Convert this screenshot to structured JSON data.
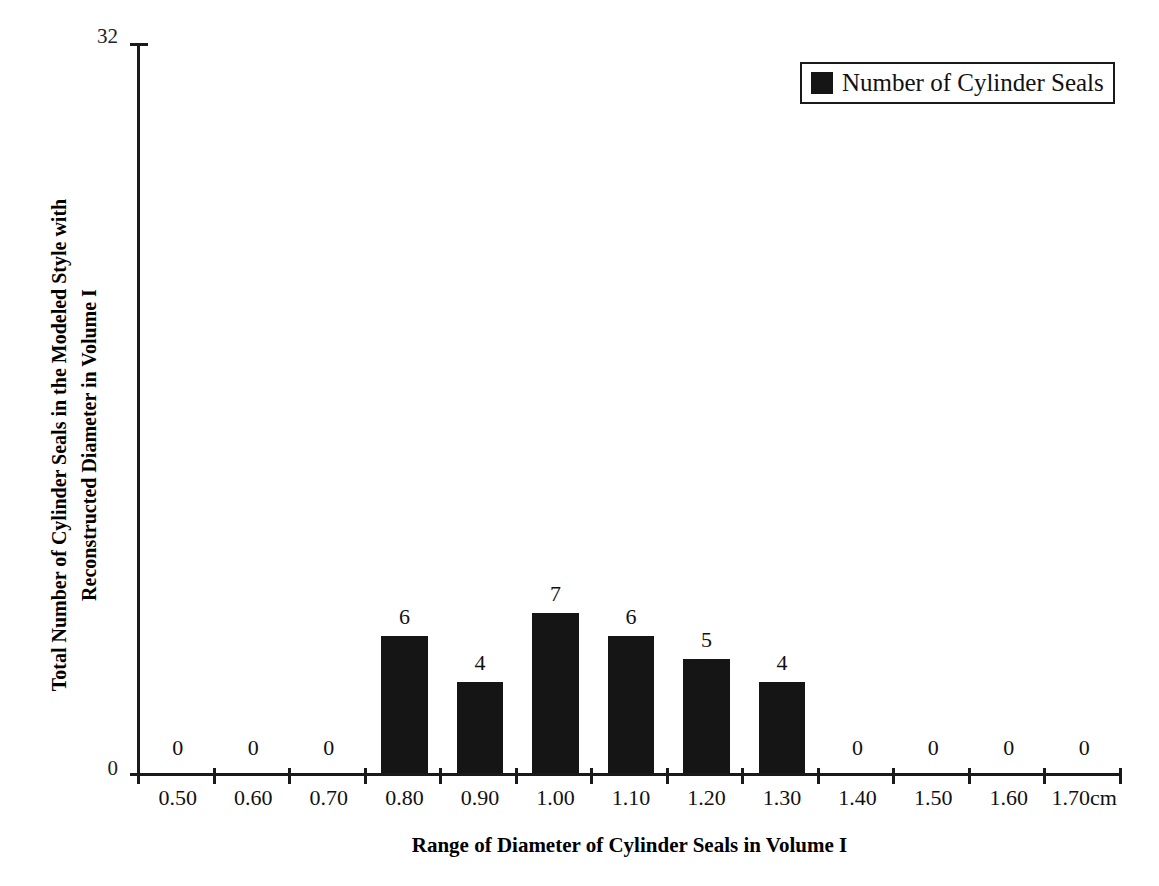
{
  "chart_data": {
    "type": "bar",
    "title": "",
    "xlabel": "Range of Diameter of Cylinder Seals in Volume I",
    "ylabel_line1": "Total Number of Cylinder Seals in the Modeled Style with",
    "ylabel_line2": "Reconstructed Diameter in Volume I",
    "categories": [
      "0.50",
      "0.60",
      "0.70",
      "0.80",
      "0.90",
      "1.00",
      "1.10",
      "1.20",
      "1.30",
      "1.40",
      "1.50",
      "1.60",
      "1.70cm"
    ],
    "values": [
      0,
      0,
      0,
      6,
      4,
      7,
      6,
      5,
      4,
      0,
      0,
      0,
      0
    ],
    "value_labels": [
      "0",
      "0",
      "0",
      "6",
      "4",
      "7",
      "6",
      "5",
      "4",
      "0",
      "0",
      "0",
      "0"
    ],
    "ylim": [
      0,
      32
    ],
    "y_tick_labels": [
      "32",
      "0"
    ],
    "y_tick_values": [
      32,
      0
    ],
    "grid": false,
    "legend_position": "top-right",
    "series": [
      {
        "name": "Number of Cylinder Seals",
        "color": "#151515",
        "values": [
          0,
          0,
          0,
          6,
          4,
          7,
          6,
          5,
          4,
          0,
          0,
          0,
          0
        ]
      }
    ]
  },
  "legend": {
    "swatch_icon": "filled-square-icon",
    "label": "Number of Cylinder Seals",
    "swatch_color": "#151515"
  },
  "axes": {
    "axis_color": "#1a1a1a",
    "y_title_line1": "Total Number of Cylinder Seals in the Modeled Style with",
    "y_title_line2": "Reconstructed Diameter in Volume I",
    "x_title": "Range of Diameter of Cylinder Seals in Volume I",
    "y_max_label": "32",
    "y_min_label": "0"
  }
}
